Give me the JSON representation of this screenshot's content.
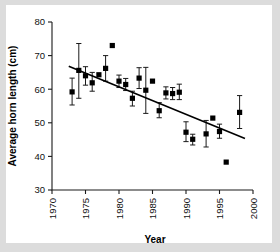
{
  "figure": {
    "background_color": "#dcdcdc",
    "card_color": "#ffffff",
    "axis_color": "#1a1a1a",
    "marker_color": "#000000"
  },
  "chart_data": {
    "type": "scatter",
    "title": "",
    "xlabel": "Year",
    "ylabel": "Average horn length (cm)",
    "xlim": [
      1970,
      2000
    ],
    "ylim": [
      30,
      80
    ],
    "xticks": [
      1970,
      1975,
      1980,
      1985,
      1990,
      1995,
      2000
    ],
    "xtick_labels": [
      "1970",
      "1975",
      "1980",
      "1985",
      "1990",
      "1995",
      "2000"
    ],
    "yticks": [
      30,
      40,
      50,
      60,
      70,
      80
    ],
    "ytick_labels": [
      "30",
      "40",
      "50",
      "60",
      "70",
      "80"
    ],
    "grid": false,
    "legend": null,
    "marker_style": "filled-square",
    "error_bars": "vertical",
    "points": [
      {
        "x": 1973,
        "y": 59.2,
        "err_low": 55.3,
        "err_high": 63.3
      },
      {
        "x": 1974,
        "y": 65.6,
        "err_low": 57.3,
        "err_high": 73.6
      },
      {
        "x": 1975,
        "y": 64.0,
        "err_low": 61.2,
        "err_high": 66.7
      },
      {
        "x": 1976,
        "y": 61.9,
        "err_low": 59.4,
        "err_high": 65.0
      },
      {
        "x": 1977,
        "y": 64.3,
        "err_low": 64.3,
        "err_high": 64.3
      },
      {
        "x": 1978,
        "y": 66.2,
        "err_low": 62.4,
        "err_high": 70.0
      },
      {
        "x": 1979,
        "y": 73.0,
        "err_low": 73.0,
        "err_high": 73.0
      },
      {
        "x": 1980,
        "y": 62.4,
        "err_low": 60.5,
        "err_high": 64.2
      },
      {
        "x": 1981,
        "y": 61.4,
        "err_low": 59.6,
        "err_high": 63.2
      },
      {
        "x": 1982,
        "y": 57.3,
        "err_low": 55.0,
        "err_high": 59.4
      },
      {
        "x": 1983,
        "y": 63.3,
        "err_low": 60.2,
        "err_high": 66.4
      },
      {
        "x": 1984,
        "y": 59.7,
        "err_low": 52.8,
        "err_high": 66.5
      },
      {
        "x": 1985,
        "y": 62.4,
        "err_low": 62.4,
        "err_high": 62.4
      },
      {
        "x": 1986,
        "y": 53.6,
        "err_low": 51.5,
        "err_high": 56.0
      },
      {
        "x": 1987,
        "y": 58.9,
        "err_low": 57.1,
        "err_high": 60.7
      },
      {
        "x": 1988,
        "y": 58.7,
        "err_low": 56.9,
        "err_high": 60.5
      },
      {
        "x": 1989,
        "y": 59.1,
        "err_low": 56.9,
        "err_high": 61.5
      },
      {
        "x": 1990,
        "y": 47.2,
        "err_low": 44.4,
        "err_high": 50.3
      },
      {
        "x": 1991,
        "y": 45.1,
        "err_low": 43.4,
        "err_high": 46.6
      },
      {
        "x": 1993,
        "y": 46.7,
        "err_low": 42.8,
        "err_high": 50.7
      },
      {
        "x": 1994,
        "y": 51.4,
        "err_low": 51.4,
        "err_high": 51.4
      },
      {
        "x": 1995,
        "y": 47.4,
        "err_low": 45.4,
        "err_high": 49.6
      },
      {
        "x": 1996,
        "y": 38.3,
        "err_low": 38.3,
        "err_high": 38.3
      },
      {
        "x": 1998,
        "y": 53.1,
        "err_low": 48.3,
        "err_high": 58.1
      }
    ],
    "trendline": {
      "x_start": 1972.5,
      "y_start": 66.8,
      "x_end": 1998.8,
      "y_end": 45.3
    }
  }
}
